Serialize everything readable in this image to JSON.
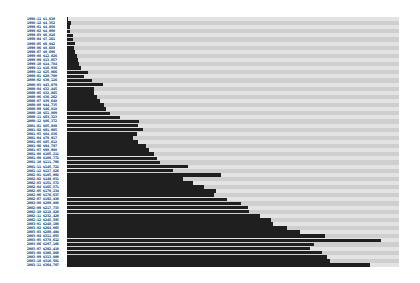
{
  "chart_data": {
    "type": "bar",
    "orientation": "horizontal",
    "title": "",
    "xlabel": "",
    "ylabel": "",
    "grid": false,
    "legend": null,
    "colors": {
      "bar": "#1f1f1f",
      "stripe_light": "#e3e3e3",
      "stripe_dark": "#cfcfcf",
      "background": "#ffffff"
    },
    "plot_area": {
      "left": 67,
      "top": 17,
      "right": 399,
      "bottom": 267
    },
    "xlim": [
      0,
      400000
    ],
    "categories": [
      "1998-11 $1,630",
      "1998-12 $4,352",
      "1999-01 $4,056",
      "1999-02 $4,090",
      "1999-03 $6,816",
      "1999-04 $7,261",
      "1999-05 $9,942",
      "1999-06 $8,688",
      "1999-07 $9,696",
      "1999-08 $12,026",
      "1999-09 $13,057",
      "1999-10 $14,784",
      "1999-11 $16,936",
      "1999-12 $25,066",
      "2000-01 $20,700",
      "2000-02 $30,126",
      "2000-03 $43,079",
      "2000-04 $32,445",
      "2000-05 $32,865",
      "2000-06 $36,262",
      "2000-07 $39,648",
      "2000-08 $44,735",
      "2000-09 $46,818",
      "2000-10 $51,809",
      "2000-11 $63,323",
      "2000-12 $86,372",
      "2001-01 $85,880",
      "2001-02 $91,965",
      "2001-03 $84,836",
      "2001-04 $79,917",
      "2001-05 $85,612",
      "2001-06 $94,797",
      "2001-07 $98,988",
      "2001-08 $105,211",
      "2001-09 $108,772",
      "2001-10 $111,708",
      "2001-11 $145,722",
      "2001-12 $127,826",
      "2002-01 $185,002",
      "2002-02 $140,031",
      "2002-03 $151,572",
      "2002-04 $165,571",
      "2002-05 $179,234",
      "2002-06 $176,637",
      "2002-07 $192,430",
      "2002-08 $209,888",
      "2002-09 $217,733",
      "2002-10 $218,820",
      "2002-11 $232,420",
      "2002-12 $245,595",
      "2003-01 $248,108",
      "2003-02 $264,965",
      "2003-03 $280,404",
      "2003-04 $311,055",
      "2003-05 $378,612",
      "2003-06 $297,108",
      "2003-07 $292,410",
      "2003-08 $306,860",
      "2003-09 $313,800",
      "2003-10 $316,501",
      "2003-11 $364,707"
    ],
    "values": [
      1630,
      4352,
      4056,
      4090,
      6816,
      7261,
      9942,
      8688,
      9696,
      12026,
      13057,
      14784,
      16936,
      25066,
      20700,
      30126,
      43079,
      32445,
      32865,
      36262,
      39648,
      44735,
      46818,
      51809,
      63323,
      86372,
      85880,
      91965,
      84836,
      79917,
      85612,
      94797,
      98988,
      105211,
      108772,
      111708,
      145722,
      127826,
      185002,
      140031,
      151572,
      165571,
      179234,
      176637,
      192430,
      209888,
      217733,
      218820,
      232420,
      245595,
      248108,
      264965,
      280404,
      311055,
      378612,
      297108,
      292410,
      306860,
      313800,
      316501,
      364707
    ]
  }
}
